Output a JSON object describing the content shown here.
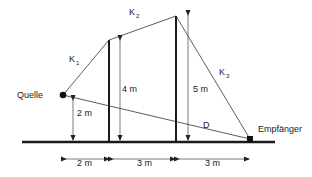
{
  "diagram": {
    "source_label": "Quelle",
    "receiver_label": "Empfänger",
    "path_labels": {
      "k1": {
        "main": "K",
        "sub": "1"
      },
      "k2": {
        "main": "K",
        "sub": "2"
      },
      "k3": {
        "main": "K",
        "sub": "3"
      },
      "direct": "D"
    },
    "heights": {
      "source": "2 m",
      "barrier1": "4 m",
      "barrier2": "5 m"
    },
    "distances": [
      "2 m",
      "3 m",
      "3 m"
    ],
    "colors": {
      "line": "#222222",
      "ground": "#1a1a1a"
    }
  }
}
